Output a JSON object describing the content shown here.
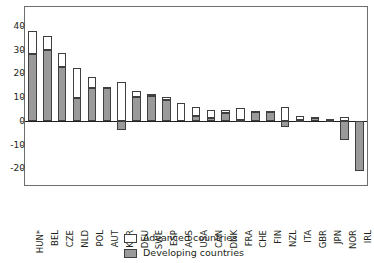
{
  "chart_data": {
    "type": "bar",
    "title": "",
    "subtitle": "",
    "xlabel": "",
    "ylabel": "",
    "ylim": [
      -27,
      48
    ],
    "yticks": [
      40,
      30,
      20,
      10,
      0,
      -10,
      -20
    ],
    "ytick_labels": [
      "40",
      "30",
      "20",
      "10",
      "0",
      "-10",
      "-20"
    ],
    "grid": false,
    "stacked": true,
    "legend_position": "bottom-center",
    "categories": [
      "HUN*",
      "BEL",
      "CZE",
      "NLD",
      "POL",
      "AUT",
      "KOR",
      "DEU",
      "SWE",
      "ESP",
      "AUS",
      "USA",
      "CAN",
      "DNK",
      "FRA",
      "CHE",
      "FIN",
      "NZL",
      "ITA",
      "GBR",
      "JPN",
      "NOR",
      "IRL"
    ],
    "series": [
      {
        "name": "Developing countries",
        "color": "#9a9a9a",
        "values": [
          28.0,
          30.0,
          22.8,
          9.7,
          14.0,
          14.0,
          -4.0,
          10.0,
          10.7,
          8.8,
          0.0,
          2.2,
          1.2,
          3.3,
          0.2,
          3.9,
          3.6,
          -2.7,
          0.3,
          1.4,
          0.4,
          -8.2,
          -21.3
        ]
      },
      {
        "name": "Advanced countries",
        "color": "#ffffff",
        "values": [
          10.0,
          5.8,
          5.7,
          12.8,
          4.4,
          0.5,
          16.4,
          2.5,
          0.8,
          1.2,
          7.5,
          3.8,
          3.5,
          1.4,
          5.1,
          0.1,
          0.4,
          5.7,
          1.8,
          0.4,
          0.2,
          1.6,
          0.0
        ]
      }
    ],
    "totals": [
      38.0,
      35.8,
      28.5,
      22.5,
      18.4,
      14.5,
      16.4,
      12.5,
      11.5,
      10.0,
      7.5,
      6.0,
      4.7,
      4.7,
      5.3,
      4.0,
      4.0,
      5.7,
      2.1,
      1.8,
      0.6,
      1.6,
      0.0
    ]
  },
  "legend": {
    "items": [
      {
        "label": "Advanced countries",
        "swatch": "white-square-swatch"
      },
      {
        "label": "Developing countries",
        "swatch": "grey-square-swatch"
      }
    ]
  }
}
